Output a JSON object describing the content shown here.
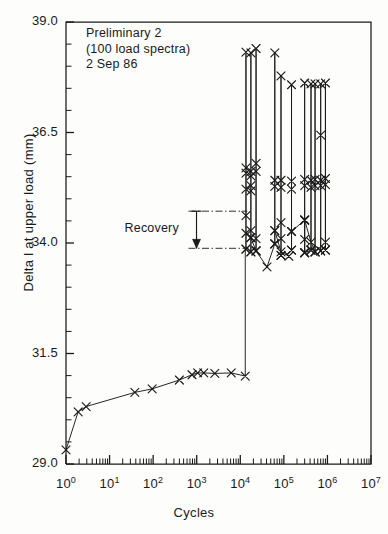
{
  "figure": {
    "background": "#fdfdfc",
    "ink": "#1a1a1a"
  },
  "annotation": {
    "line1": "Preliminary 2",
    "line2": "(100 load spectra)",
    "line3": "2 Sep 86"
  },
  "recovery": {
    "label": "Recovery",
    "top_value": 34.72,
    "bottom_value": 33.88,
    "line_x_start": 1100,
    "line_x_end": 14500
  },
  "chart_data": {
    "type": "line",
    "title": "",
    "subtitle": "",
    "xlabel": "Cycles",
    "ylabel": "Delta l at upper load (mm)",
    "xscale": "log",
    "yscale": "linear",
    "xlim": [
      1,
      10000000
    ],
    "ylim": [
      29.0,
      39.0
    ],
    "grid": false,
    "legend": null,
    "marker": "x",
    "xticklabels": [
      "10^0",
      "10^1",
      "10^2",
      "10^3",
      "10^4",
      "10^5",
      "10^6",
      "10^7"
    ],
    "xtick_mantissas": [
      "1",
      "1",
      "1",
      "1",
      "1",
      "1",
      "1",
      "1"
    ],
    "xtick_exponents": [
      "0",
      "1",
      "2",
      "3",
      "4",
      "5",
      "6",
      "7"
    ],
    "yticklabels": [
      "29.0",
      "31.5",
      "34.0",
      "36.5",
      "39.0"
    ],
    "ytickvalues": [
      29.0,
      31.5,
      34.0,
      36.5,
      39.0
    ],
    "yminor_per_major": 4,
    "xminor_subdivisions": [
      2,
      3,
      4,
      5,
      6,
      7,
      8,
      9
    ],
    "series": [
      {
        "name": "baseline-growth",
        "marker": "x",
        "points": [
          [
            1.0,
            29.32
          ],
          [
            1.9,
            30.18
          ],
          [
            2.9,
            30.3
          ],
          [
            38.0,
            30.62
          ],
          [
            95.0,
            30.7
          ],
          [
            400.0,
            30.9
          ],
          [
            780.0,
            31.02
          ],
          [
            1050.0,
            31.06
          ],
          [
            1450.0,
            31.06
          ],
          [
            2600.0,
            31.05
          ],
          [
            6200.0,
            31.06
          ],
          [
            13000.0,
            30.99
          ]
        ]
      },
      {
        "name": "riser-to-cluster-1",
        "marker": "none",
        "points": [
          [
            13000.0,
            30.99
          ],
          [
            13000.0,
            33.86
          ]
        ]
      },
      {
        "name": "spike-1",
        "marker": "x",
        "points": [
          [
            13500.0,
            33.86
          ],
          [
            13500.0,
            34.22
          ],
          [
            13500.0,
            34.62
          ],
          [
            13500.0,
            35.22
          ],
          [
            13500.0,
            35.58
          ],
          [
            13500.0,
            35.7
          ],
          [
            13500.0,
            38.32
          ],
          [
            13500.0,
            33.86
          ]
        ]
      },
      {
        "name": "spike-2",
        "marker": "x",
        "points": [
          [
            17500.0,
            33.8
          ],
          [
            17500.0,
            34.12
          ],
          [
            17500.0,
            34.28
          ],
          [
            17500.0,
            35.18
          ],
          [
            17500.0,
            35.3
          ],
          [
            17500.0,
            35.52
          ],
          [
            17500.0,
            35.62
          ],
          [
            17500.0,
            38.3
          ],
          [
            17500.0,
            33.8
          ]
        ]
      },
      {
        "name": "spike-3",
        "marker": "x",
        "points": [
          [
            23000.0,
            33.82
          ],
          [
            23000.0,
            34.1
          ],
          [
            23000.0,
            35.62
          ],
          [
            23000.0,
            35.8
          ],
          [
            23000.0,
            38.4
          ],
          [
            23000.0,
            33.82
          ]
        ]
      },
      {
        "name": "connector-1",
        "marker": "x",
        "points": [
          [
            17500.0,
            34.12
          ],
          [
            23000.0,
            33.82
          ],
          [
            41000.0,
            33.46
          ],
          [
            62000.0,
            33.98
          ]
        ]
      },
      {
        "name": "spike-4",
        "marker": "x",
        "points": [
          [
            62000.0,
            33.98
          ],
          [
            62000.0,
            34.28
          ],
          [
            62000.0,
            35.28
          ],
          [
            62000.0,
            35.42
          ],
          [
            62000.0,
            38.3
          ],
          [
            62000.0,
            33.98
          ]
        ]
      },
      {
        "name": "spike-5",
        "marker": "x",
        "points": [
          [
            86000.0,
            33.72
          ],
          [
            86000.0,
            34.1
          ],
          [
            86000.0,
            34.46
          ],
          [
            86000.0,
            35.26
          ],
          [
            86000.0,
            35.42
          ],
          [
            86000.0,
            37.78
          ],
          [
            86000.0,
            33.72
          ]
        ]
      },
      {
        "name": "connector-2",
        "marker": "x",
        "points": [
          [
            62000.0,
            34.28
          ],
          [
            86000.0,
            33.8
          ],
          [
            130000.0,
            33.7
          ]
        ]
      },
      {
        "name": "spike-6",
        "marker": "x",
        "points": [
          [
            150000.0,
            33.84
          ],
          [
            150000.0,
            34.26
          ],
          [
            150000.0,
            35.22
          ],
          [
            150000.0,
            35.4
          ],
          [
            150000.0,
            37.58
          ],
          [
            150000.0,
            33.84
          ]
        ]
      },
      {
        "name": "spike-7",
        "marker": "x",
        "points": [
          [
            300000.0,
            33.78
          ],
          [
            300000.0,
            34.08
          ],
          [
            300000.0,
            34.52
          ],
          [
            300000.0,
            35.3
          ],
          [
            300000.0,
            35.44
          ],
          [
            300000.0,
            37.62
          ],
          [
            300000.0,
            33.78
          ]
        ]
      },
      {
        "name": "spike-8",
        "marker": "x",
        "points": [
          [
            420000.0,
            33.84
          ],
          [
            420000.0,
            35.26
          ],
          [
            420000.0,
            35.42
          ],
          [
            420000.0,
            37.6
          ],
          [
            420000.0,
            33.84
          ]
        ]
      },
      {
        "name": "spike-9",
        "marker": "x",
        "points": [
          [
            520000.0,
            33.8
          ],
          [
            520000.0,
            35.3
          ],
          [
            520000.0,
            35.44
          ],
          [
            520000.0,
            37.6
          ],
          [
            520000.0,
            33.8
          ]
        ]
      },
      {
        "name": "spike-10",
        "marker": "x",
        "points": [
          [
            700000.0,
            33.82
          ],
          [
            700000.0,
            35.3
          ],
          [
            700000.0,
            35.42
          ],
          [
            700000.0,
            36.44
          ],
          [
            700000.0,
            37.6
          ],
          [
            700000.0,
            33.82
          ]
        ]
      },
      {
        "name": "spike-11",
        "marker": "x",
        "points": [
          [
            900000.0,
            33.84
          ],
          [
            900000.0,
            34.02
          ],
          [
            900000.0,
            35.32
          ],
          [
            900000.0,
            35.46
          ],
          [
            900000.0,
            37.62
          ],
          [
            900000.0,
            33.84
          ]
        ]
      },
      {
        "name": "connector-3",
        "marker": "x",
        "points": [
          [
            150000.0,
            34.26
          ],
          [
            300000.0,
            34.52
          ],
          [
            300000.0,
            33.78
          ],
          [
            420000.0,
            33.84
          ]
        ]
      },
      {
        "name": "connector-4",
        "marker": "x",
        "points": [
          [
            300000.0,
            34.52
          ],
          [
            420000.0,
            34.02
          ],
          [
            520000.0,
            33.8
          ]
        ]
      }
    ]
  }
}
